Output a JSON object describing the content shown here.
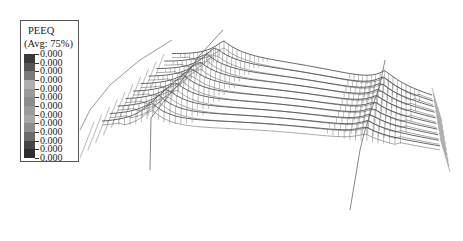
{
  "legend": {
    "title": "PEEQ",
    "subtitle": "(Avg: 75%)",
    "values": [
      "0.000",
      "0.000",
      "0.000",
      "0.000",
      "0.000",
      "0.000",
      "0.000",
      "0.000",
      "0.000",
      "0.000",
      "0.000",
      "0.000",
      "0.000"
    ],
    "band_colors": [
      "#3a3a3a",
      "#555555",
      "#7a7a7a",
      "#b0b0b0",
      "#9a9a9a",
      "#8c8c8c",
      "#9c9c9c",
      "#a8a8a8",
      "#8e8e8e",
      "#6a6a6a",
      "#444444",
      "#2e2e2e"
    ]
  },
  "model": {
    "type": "3D deformed wireframe mesh",
    "ridge_lines": 10,
    "peaks": [
      {
        "name": "left-peak",
        "x": 223,
        "y": 32
      },
      {
        "name": "right-peak",
        "x": 385,
        "y": 63
      }
    ],
    "line_color": "#555555"
  }
}
